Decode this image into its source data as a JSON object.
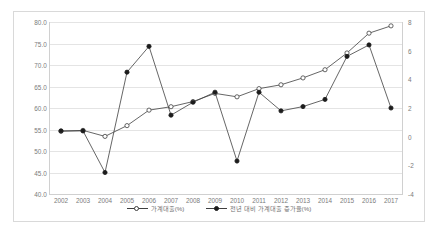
{
  "chart_data": {
    "type": "line",
    "title": "",
    "xlabel": "",
    "ylabel": "",
    "grid": true,
    "legend_position": "bottom",
    "categories": [
      "2002",
      "2003",
      "2004",
      "2005",
      "2006",
      "2007",
      "2008",
      "2009",
      "2010",
      "2011",
      "2012",
      "2013",
      "2014",
      "2015",
      "2016",
      "2017"
    ],
    "y_left": {
      "label": "가계대출(%)",
      "ylim": [
        40.0,
        80.0
      ],
      "ticks": [
        "40.0",
        "45.0",
        "50.0",
        "55.0",
        "60.0",
        "65.0",
        "70.0",
        "75.0",
        "80.0"
      ]
    },
    "y_right": {
      "label": "전년 대비 가계대출 증가율(%)",
      "ylim": [
        -4,
        8
      ],
      "ticks": [
        "-4",
        "-2",
        "0",
        "2",
        "4",
        "6",
        "8"
      ]
    },
    "series": [
      {
        "name": "가계대출(%)",
        "axis": "left",
        "marker": "open-circle",
        "values": [
          54.6,
          54.8,
          53.4,
          55.9,
          59.5,
          60.3,
          61.5,
          63.4,
          62.6,
          64.5,
          65.4,
          67.0,
          68.9,
          72.8,
          77.4,
          79.1
        ]
      },
      {
        "name": "전년 대비 가계대출 증가율(%)",
        "axis": "right",
        "marker": "filled-circle",
        "values": [
          0.4,
          0.4,
          -2.5,
          4.5,
          6.3,
          1.5,
          2.4,
          3.1,
          -1.7,
          3.1,
          1.8,
          2.1,
          2.6,
          5.6,
          6.4,
          2.0
        ]
      }
    ]
  },
  "legend": {
    "items": [
      {
        "label": "가계대출(%)",
        "marker": "open-circle"
      },
      {
        "label": "전년 대비 가계대출 증가율(%)",
        "marker": "filled-circle"
      }
    ]
  },
  "colors": {
    "series_line": "#3f3f3f",
    "grid": "#e4e4e4",
    "tick_text": "#7b7b7b",
    "frame_border": "#d9d9d9"
  }
}
